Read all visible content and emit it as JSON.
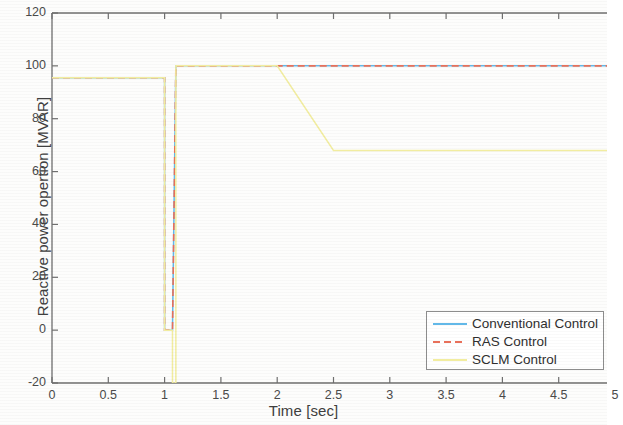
{
  "chart_data": {
    "type": "line",
    "title": "",
    "xlabel": "Time [sec]",
    "ylabel": "Reactive power opertion [MVAR]",
    "xlim": [
      0,
      5
    ],
    "ylim": [
      -20,
      120
    ],
    "xticks": [
      "0",
      "0.5",
      "1",
      "1.5",
      "2",
      "2.5",
      "3",
      "3.5",
      "4",
      "4.5",
      "5"
    ],
    "xtick_values": [
      0,
      0.5,
      1,
      1.5,
      2,
      2.5,
      3,
      3.5,
      4,
      4.5,
      5
    ],
    "yticks": [
      "120",
      "100",
      "80",
      "60",
      "40",
      "20",
      "0",
      "-20"
    ],
    "ytick_values": [
      120,
      100,
      80,
      60,
      40,
      20,
      0,
      -20
    ],
    "grid": false,
    "legend_position": "lower right",
    "series": [
      {
        "name": "Conventional Control",
        "color": "#62B8E8",
        "style": "solid",
        "x": [
          0,
          1.0,
          1.0,
          1.07,
          1.07,
          1.1,
          1.1,
          5.0
        ],
        "y": [
          95.5,
          95.5,
          0,
          0,
          0,
          100,
          100,
          100
        ]
      },
      {
        "name": "RAS Control",
        "color": "#E8705A",
        "style": "dashed",
        "x": [
          0,
          1.0,
          1.0,
          1.07,
          1.07,
          1.1,
          1.1,
          5.0
        ],
        "y": [
          95.5,
          95.5,
          0,
          0,
          0,
          100,
          100,
          100
        ]
      },
      {
        "name": "SCLM Control",
        "color": "#F2EDA0",
        "style": "solid",
        "x": [
          0,
          1.0,
          1.0,
          1.07,
          1.07,
          1.1,
          1.1,
          2.0,
          2.5,
          5.0
        ],
        "y": [
          95.5,
          95.5,
          0,
          0,
          -20,
          -20,
          100,
          100,
          68,
          68
        ]
      }
    ],
    "annotations": [
      "Orange/amber transient traces overlap along the step at t = 1.0 s",
      "SCLM trace dips to -20 MVAR between t = 1.07 s and t = 1.1 s",
      "SCLM trace ramps from 100 MVAR at t = 2.0 s down to 68 MVAR at t = 2.5 s"
    ]
  },
  "legend": {
    "items": [
      {
        "label": "Conventional Control",
        "color": "#62B8E8",
        "style": "solid"
      },
      {
        "label": "RAS Control",
        "color": "#E8705A",
        "style": "dashed"
      },
      {
        "label": "SCLM Control",
        "color": "#F2EDA0",
        "style": "solid"
      }
    ]
  },
  "axes": {
    "x_title": "Time [sec]",
    "y_title": "Reactive power opertion [MVAR]"
  }
}
